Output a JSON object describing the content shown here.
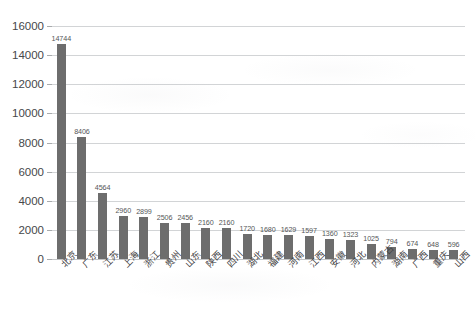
{
  "chart_data": {
    "type": "bar",
    "title": "",
    "subtitle": "",
    "xlabel": "",
    "ylabel": "",
    "ylim": [
      0,
      16000
    ],
    "ytick_step": 2000,
    "ytick_labels": [
      "16000",
      "14000",
      "12000",
      "10000",
      "8000",
      "6000",
      "4000",
      "2000",
      "0"
    ],
    "ytick_values": [
      16000,
      14000,
      12000,
      10000,
      8000,
      6000,
      4000,
      2000,
      0
    ],
    "grid": "horizontal-only",
    "legend": "none",
    "bar_color": "#6d6d6d",
    "gridline_color": "#d2d4d6",
    "data_labels_shown": true,
    "categories": [
      "北京",
      "广东",
      "江苏",
      "上海",
      "浙江",
      "贵州",
      "山东",
      "陕西",
      "四川",
      "湖北",
      "福建",
      "河南",
      "江西",
      "安徽",
      "河北",
      "内蒙古",
      "湖南",
      "广西",
      "重庆",
      "山西"
    ],
    "values": [
      14744,
      8406,
      4564,
      2960,
      2899,
      2506,
      2456,
      2160,
      2160,
      1720,
      1680,
      1629,
      1597,
      1360,
      1323,
      1025,
      794,
      674,
      648,
      596
    ],
    "series": [
      {
        "name": "",
        "values": [
          14744,
          8406,
          4564,
          2960,
          2899,
          2506,
          2456,
          2160,
          2160,
          1720,
          1680,
          1629,
          1597,
          1360,
          1323,
          1025,
          794,
          674,
          648,
          596
        ]
      }
    ]
  }
}
